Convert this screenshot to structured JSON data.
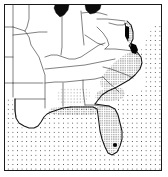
{
  "figure": {
    "name": "distribution-map",
    "kind": "black-and-white species distribution map",
    "region": "Southeastern United States",
    "width": 168,
    "height": 177,
    "has_text_labels": false,
    "has_scale_bar": false,
    "has_legend": false,
    "background_color": "#ffffff",
    "frame_color": "#1a1a1a"
  },
  "colors": {
    "outline": "#141414",
    "state_border": "#3c3c3c",
    "ocean_stipple_dot": "#4a4a4a",
    "range_stipple_dot": "#3a3a3a",
    "lake_fill": "#0c0c0c",
    "locality_dot": "#050505",
    "land_fill": "#ffffff"
  },
  "layers": [
    {
      "name": "ocean-stipple",
      "label": "stippled water (Atlantic Ocean and Gulf of Mexico)",
      "pattern": "coarse dot screen",
      "dot_spacing_px": 4.6
    },
    {
      "name": "land-fill",
      "label": "unshaded land (outside range)",
      "pattern": "solid white"
    },
    {
      "name": "range-shading",
      "label": "shaded distribution range (coastal plain)",
      "pattern": "fine dot screen",
      "dot_spacing_px": 2.3
    },
    {
      "name": "state-boundaries",
      "label": "state boundary lines",
      "pattern": "thin grey lines"
    },
    {
      "name": "coastline",
      "label": "coastline and national outline",
      "pattern": "heavy black line"
    },
    {
      "name": "great-lakes",
      "label": "solid black lake bodies at top edge",
      "count": 2
    },
    {
      "name": "locality-dots",
      "label": "solid black locality records",
      "count": 2
    }
  ],
  "features": {
    "great_lakes": [
      {
        "name": "lake-michigan-patch",
        "position": "top centre-left"
      },
      {
        "name": "lake-erie-patch",
        "position": "top centre-right"
      }
    ],
    "locality_dots": [
      {
        "name": "locality-dot-south-florida",
        "position": "southern Florida peninsula"
      },
      {
        "name": "locality-dot-chesapeake",
        "position": "Chesapeake Bay / Delmarva coast"
      }
    ],
    "range_extent": "Atlantic coastal plain from the Chesapeake south through the Carolinas and Georgia, across the Florida peninsula, and west along the Gulf coast through Alabama and Mississippi"
  }
}
